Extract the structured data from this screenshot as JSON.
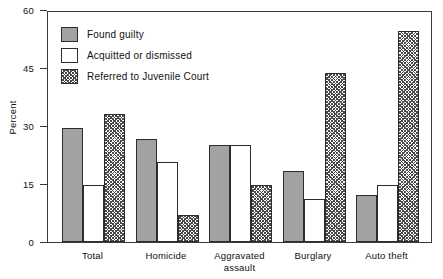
{
  "chart_data": {
    "type": "bar",
    "title": "",
    "xlabel": "",
    "ylabel": "Percent",
    "ylim": [
      0,
      60
    ],
    "yticks": [
      0,
      15,
      30,
      45,
      60
    ],
    "ytick_labels": [
      "0",
      "15",
      "30",
      "45",
      "60"
    ],
    "grid": false,
    "legend_position": "upper left",
    "categories": [
      "Total",
      "Homicide",
      "Aggravated assault",
      "Burglary",
      "Auto theft"
    ],
    "category_lines": [
      [
        "Total"
      ],
      [
        "Homicide"
      ],
      [
        "Aggravated",
        "assault"
      ],
      [
        "Burglary"
      ],
      [
        "Auto theft"
      ]
    ],
    "series": [
      {
        "name": "Found guilty",
        "fill": "solid",
        "color": "#a2a2a2",
        "values": [
          29.4,
          26.6,
          25.2,
          18.4,
          12.2
        ]
      },
      {
        "name": "Acquitted or dismissed",
        "fill": "open",
        "color": "#ffffff",
        "values": [
          14.7,
          20.7,
          25.2,
          11.1,
          14.7
        ]
      },
      {
        "name": "Referred to Juvenile Court",
        "fill": "hatch",
        "color": "#4a4a4a",
        "values": [
          33.0,
          7.0,
          14.7,
          43.7,
          54.5
        ]
      }
    ]
  },
  "legend": {
    "items": [
      {
        "label": "Found guilty",
        "fill": "solid"
      },
      {
        "label": "Acquitted or dismissed",
        "fill": "open"
      },
      {
        "label": "Referred to Juvenile Court",
        "fill": "hatch"
      }
    ]
  },
  "colors": {
    "bar_solid": "#a2a2a2",
    "bar_open": "#ffffff",
    "bar_hatch": "#4a4a4a",
    "axis": "#3a3a3a",
    "text": "#111111",
    "background": "#ffffff"
  }
}
